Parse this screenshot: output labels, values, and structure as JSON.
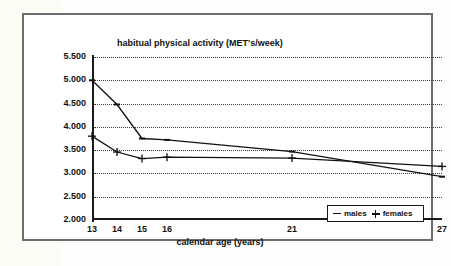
{
  "figure": {
    "title": "habitual physical activity (MET's/week)",
    "xaxis_title": "calendar age (years)"
  },
  "legend": {
    "males_label": "males",
    "females_label": "females",
    "males_marker": "dash-marker",
    "females_marker": "plus-marker"
  },
  "axis": {
    "y_ticks": [
      "5.500",
      "5.000",
      "4.500",
      "4.000",
      "3.500",
      "3.000",
      "2.500",
      "2.000"
    ],
    "x_ticks": [
      "13",
      "14",
      "15",
      "16",
      "21",
      "27"
    ]
  },
  "chart_data": {
    "type": "line",
    "title": "habitual physical activity (MET's/week)",
    "xlabel": "calendar age (years)",
    "ylabel": "habitual physical activity (MET's/week)",
    "x": [
      13,
      14,
      15,
      16,
      21,
      27
    ],
    "xtick_labels": [
      "13",
      "14",
      "15",
      "16",
      "21",
      "27"
    ],
    "ytick_labels": [
      "5.500",
      "5.000",
      "4.500",
      "4.000",
      "3.500",
      "3.000",
      "2.500",
      "2.000"
    ],
    "ytick_values": [
      5.5,
      5.0,
      4.5,
      4.0,
      3.5,
      3.0,
      2.5,
      2.0
    ],
    "ylim": [
      2.0,
      5.5
    ],
    "xlim": [
      13,
      27
    ],
    "grid": "horizontal-dotted",
    "legend_position": "lower-right",
    "series": [
      {
        "name": "males",
        "marker": "dash",
        "values": [
          5.0,
          4.48,
          3.75,
          3.72,
          3.47,
          2.93
        ]
      },
      {
        "name": "females",
        "marker": "plus",
        "values": [
          3.8,
          3.46,
          3.32,
          3.35,
          3.33,
          3.15
        ]
      }
    ]
  }
}
